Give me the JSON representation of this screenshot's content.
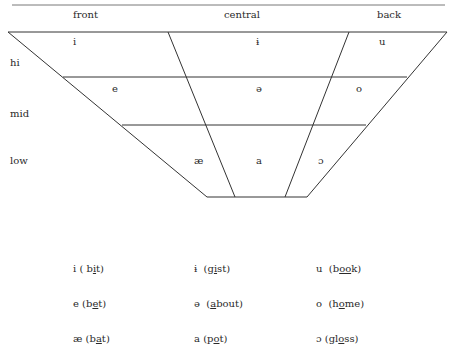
{
  "chart": {
    "columns": [
      {
        "label": "front",
        "x": 73
      },
      {
        "label": "central",
        "x": 224
      },
      {
        "label": "back",
        "x": 377
      }
    ],
    "rows": [
      {
        "label": "hi",
        "y": 57
      },
      {
        "label": "mid",
        "y": 108
      },
      {
        "label": "low",
        "y": 155
      }
    ],
    "vowels": [
      {
        "symbol": "i",
        "x": 73,
        "y": 36
      },
      {
        "symbol": "ɨ",
        "x": 256,
        "y": 36
      },
      {
        "symbol": "u",
        "x": 379,
        "y": 36
      },
      {
        "symbol": "e",
        "x": 112,
        "y": 83
      },
      {
        "symbol": "ə",
        "x": 256,
        "y": 83
      },
      {
        "symbol": "o",
        "x": 356,
        "y": 83
      },
      {
        "symbol": "æ",
        "x": 194,
        "y": 155
      },
      {
        "symbol": "a",
        "x": 256,
        "y": 155
      },
      {
        "symbol": "ɔ",
        "x": 318,
        "y": 155
      }
    ]
  },
  "examples": [
    {
      "symbol": "i",
      "pre": " ( b",
      "ul": "i",
      "post": "t)",
      "x": 73,
      "y": 263
    },
    {
      "symbol": "ɨ",
      "pre": "  (g",
      "ul": "i",
      "post": "st)",
      "x": 194,
      "y": 263
    },
    {
      "symbol": "u",
      "pre": "  (b",
      "ul": "oo",
      "post": "k)",
      "x": 316,
      "y": 263
    },
    {
      "symbol": "e",
      "pre": " (b",
      "ul": "e",
      "post": "t)",
      "x": 73,
      "y": 298
    },
    {
      "symbol": "ə",
      "pre": "  (",
      "ul": "a",
      "post": "bout)",
      "x": 194,
      "y": 298
    },
    {
      "symbol": "o",
      "pre": "  (h",
      "ul": "o",
      "post": "me)",
      "x": 316,
      "y": 298
    },
    {
      "symbol": "æ",
      "pre": " (b",
      "ul": "a",
      "post": "t)",
      "x": 73,
      "y": 333
    },
    {
      "symbol": "a",
      "pre": " (p",
      "ul": "o",
      "post": "t)",
      "x": 194,
      "y": 333
    },
    {
      "symbol": "ɔ",
      "pre": " (gl",
      "ul": "o",
      "post": "ss)",
      "x": 316,
      "y": 333
    }
  ],
  "colors": {
    "line": "#333333",
    "text": "#2a2a2a"
  }
}
